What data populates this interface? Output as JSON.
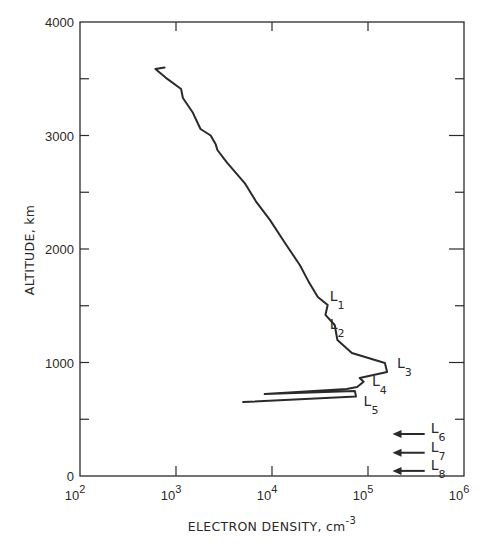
{
  "chart_data": {
    "type": "line",
    "title": "",
    "xlabel": "ELECTRON DENSITY, cm",
    "xlabel_superscript": "-3",
    "ylabel": "ALTITUDE, km",
    "xscale": "log",
    "xlim": [
      100,
      1000000
    ],
    "ylim": [
      0,
      4000
    ],
    "grid": false,
    "x_ticks": [
      {
        "base": "10",
        "exp": "2",
        "value": 100
      },
      {
        "base": "10",
        "exp": "3",
        "value": 1000
      },
      {
        "base": "10",
        "exp": "4",
        "value": 10000
      },
      {
        "base": "10",
        "exp": "5",
        "value": 100000
      },
      {
        "base": "10",
        "exp": "6",
        "value": 1000000
      }
    ],
    "y_ticks": [
      "0",
      "1000",
      "2000",
      "3000",
      "4000"
    ],
    "y_minor_ticks": [
      500,
      1500,
      2500,
      3500
    ],
    "series": [
      {
        "name": "Electron density profile",
        "points": [
          {
            "x": 760,
            "y": 3600
          },
          {
            "x": 610,
            "y": 3585
          },
          {
            "x": 780,
            "y": 3510
          },
          {
            "x": 1130,
            "y": 3410
          },
          {
            "x": 1180,
            "y": 3330
          },
          {
            "x": 1500,
            "y": 3200
          },
          {
            "x": 1800,
            "y": 3057
          },
          {
            "x": 2300,
            "y": 3000
          },
          {
            "x": 2600,
            "y": 2920
          },
          {
            "x": 2700,
            "y": 2872
          },
          {
            "x": 3400,
            "y": 2760
          },
          {
            "x": 5200,
            "y": 2581
          },
          {
            "x": 6800,
            "y": 2420
          },
          {
            "x": 9500,
            "y": 2256
          },
          {
            "x": 13500,
            "y": 2060
          },
          {
            "x": 19500,
            "y": 1859
          },
          {
            "x": 24500,
            "y": 1700
          },
          {
            "x": 30000,
            "y": 1577
          },
          {
            "x": 38000,
            "y": 1507
          },
          {
            "x": 36000,
            "y": 1419
          },
          {
            "x": 45000,
            "y": 1330
          },
          {
            "x": 48000,
            "y": 1198
          },
          {
            "x": 68000,
            "y": 1084
          },
          {
            "x": 150000,
            "y": 996
          },
          {
            "x": 158000,
            "y": 916
          },
          {
            "x": 82000,
            "y": 863
          },
          {
            "x": 90000,
            "y": 830
          },
          {
            "x": 77000,
            "y": 784
          },
          {
            "x": 60000,
            "y": 766
          },
          {
            "x": 8400,
            "y": 722
          },
          {
            "x": 73000,
            "y": 749
          },
          {
            "x": 75000,
            "y": 700
          },
          {
            "x": 5000,
            "y": 652
          }
        ]
      }
    ],
    "annotations": [
      {
        "label": "L",
        "sub": "1",
        "x": 40000,
        "y": 1530
      },
      {
        "label": "L",
        "sub": "2",
        "x": 40000,
        "y": 1290
      },
      {
        "label": "L",
        "sub": "3",
        "x": 200000,
        "y": 940
      },
      {
        "label": "L",
        "sub": "4",
        "x": 110000,
        "y": 780
      },
      {
        "label": "L",
        "sub": "5",
        "x": 90000,
        "y": 610
      },
      {
        "label": "L",
        "sub": "6",
        "x": 450000,
        "y": 370,
        "arrow_to": 180000
      },
      {
        "label": "L",
        "sub": "7",
        "x": 450000,
        "y": 205,
        "arrow_to": 180000
      },
      {
        "label": "L",
        "sub": "8",
        "x": 450000,
        "y": 45,
        "arrow_to": 180000
      }
    ],
    "line_color": "#2a2a2a"
  }
}
